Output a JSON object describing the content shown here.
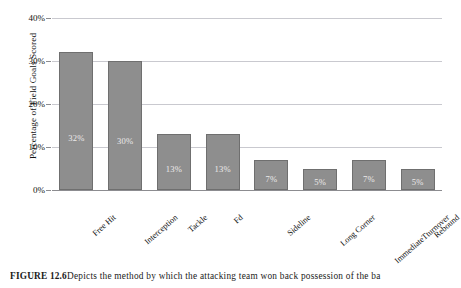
{
  "chart_data": {
    "type": "bar",
    "title": "",
    "xlabel": "",
    "ylabel": "Percentage of Field Goals Scored",
    "ylim": [
      0,
      40
    ],
    "grid": true,
    "legend": false,
    "categories": [
      "Free Hit",
      "Interception",
      "Tackle",
      "Fd",
      "Sideline",
      "Long Corner",
      "ImmediateTturnover",
      "Rebound"
    ],
    "values": [
      32,
      30,
      13,
      13,
      7,
      5,
      7,
      5
    ],
    "value_labels": [
      "32%",
      "30%",
      "13%",
      "13%",
      "7%",
      "5%",
      "7%",
      "5%"
    ],
    "ytick_values": [
      0,
      10,
      20,
      30,
      40
    ],
    "ytick_labels": [
      "0%",
      "10%",
      "20%",
      "30%",
      "40%"
    ],
    "bar_color": "#8e8e8e",
    "bar_edge_color": "#6f6f6f",
    "value_label_color": "#eceaea",
    "gridline_color": "#c9c9cf"
  },
  "caption": {
    "figure_number": "FIGURE 12.6",
    "text": "Depicts the method by which the attacking team won back possession of the ba"
  }
}
